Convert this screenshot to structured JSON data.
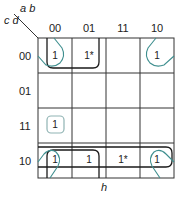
{
  "kmap": {
    "row_var": "c d",
    "col_var": "a b",
    "columns": [
      "00",
      "01",
      "11",
      "10"
    ],
    "rows": [
      "00",
      "01",
      "11",
      "10"
    ],
    "cells": [
      [
        "1",
        "1*",
        "",
        "1"
      ],
      [
        "",
        "",
        "",
        ""
      ],
      [
        "1",
        "",
        "",
        ""
      ],
      [
        "1",
        "1",
        "1*",
        "1"
      ]
    ],
    "footer_label": "h",
    "colors": {
      "grid": "#333333",
      "loop_dark": "#1a1a1a",
      "loop_teal": "#3f8f8f",
      "loop_light": "#8fb3b3"
    }
  }
}
